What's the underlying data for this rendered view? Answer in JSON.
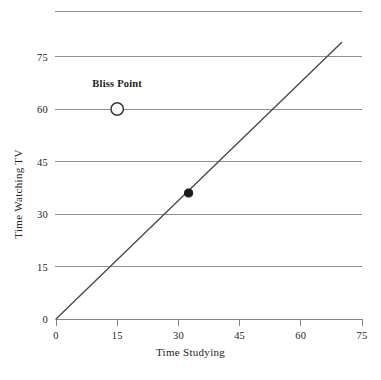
{
  "chart_data": {
    "type": "line",
    "title": "",
    "xlabel": "Time Studying",
    "ylabel": "Time Watching TV",
    "xlim": [
      0,
      75
    ],
    "ylim": [
      0,
      88
    ],
    "xticks": [
      0,
      15,
      30,
      45,
      60,
      75
    ],
    "xticklabels": [
      "0",
      "15",
      "30",
      "45",
      "60",
      "75"
    ],
    "yticks": [
      0,
      15,
      30,
      45,
      60,
      75
    ],
    "yticklabels": [
      "0",
      "15",
      "30",
      "45",
      "60",
      "75"
    ],
    "grid": "horizontal",
    "grid_values": [
      15,
      30,
      45,
      60,
      75,
      88
    ],
    "legend": "none",
    "series": [
      {
        "name": "budget-line",
        "type": "line",
        "x": [
          0,
          70
        ],
        "y": [
          0,
          79
        ],
        "slope": 1.13,
        "intercept": 0,
        "color": "#4a4a52"
      }
    ],
    "points": [
      {
        "name": "bliss-point",
        "label": "Bliss Point",
        "x": 15,
        "y": 60,
        "marker": "open-circle",
        "color": "#3a3a42"
      },
      {
        "name": "chosen-point",
        "label": "",
        "x": 32.5,
        "y": 36,
        "marker": "filled-circle",
        "color": "#1b1b1b"
      }
    ],
    "annotations": [
      {
        "text": "Bliss Point",
        "x": 15,
        "y": 67
      }
    ],
    "colors": {
      "gridline": "#8b909c",
      "axis": "#7e838e",
      "line": "#4a4a52",
      "marker_fill": "#1b1b1b",
      "marker_open_stroke": "#3a3a42",
      "text": "#242424",
      "background": "#ffffff"
    }
  },
  "axes": {
    "x_axis_name": "Time Studying",
    "y_axis_name": "Time Watching TV"
  }
}
